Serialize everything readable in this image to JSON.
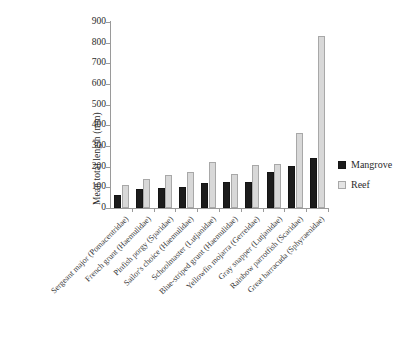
{
  "chart_data": {
    "type": "bar",
    "title": "",
    "subtitle": "",
    "xlabel": "",
    "ylabel": "Mean total length (mm)",
    "ylim": [
      0,
      900
    ],
    "ytick_step": 100,
    "yticks": [
      "900",
      "800",
      "700",
      "600",
      "500",
      "400",
      "300",
      "200",
      "100",
      "0"
    ],
    "grid": false,
    "legend_position": "right",
    "categories": [
      "Sergeant major (Pomacentridae)",
      "French grunt (Haemulidae)",
      "Pinfish porgy (Sparidae)",
      "Sailor's choice (Haemulidae)",
      "Schoolmaster (Lutjanidae)",
      "Blue-striped grunt (Haemulidae)",
      "Yellowfin mojarra (Gerreidae)",
      "Gray snapper (Lutjanidae)",
      "Rainbow parrotfish (Scaridae)",
      "Great barracuda (Sphyraenidae)"
    ],
    "series": [
      {
        "name": "Mangrove",
        "color": "#1c1c1c",
        "values": [
          62,
          90,
          95,
          100,
          120,
          125,
          125,
          175,
          205,
          240
        ]
      },
      {
        "name": "Reef",
        "color": "#d8d8d8",
        "values": [
          112,
          140,
          158,
          172,
          222,
          165,
          208,
          215,
          365,
          830
        ]
      }
    ]
  },
  "legend": {
    "items": [
      {
        "label": "Mangrove",
        "swatch": "mangrove-swatch-icon"
      },
      {
        "label": "Reef",
        "swatch": "reef-swatch-icon"
      }
    ]
  }
}
